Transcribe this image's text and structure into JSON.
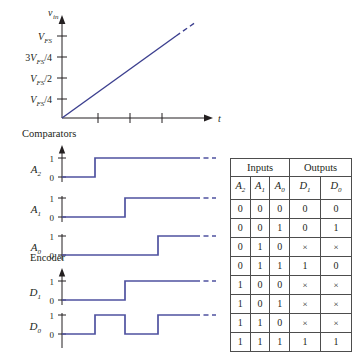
{
  "figure": {
    "title_caption": "",
    "ramp_plot": {
      "y_axis_label": "v",
      "y_axis_sub": "in",
      "x_axis_label": "t",
      "y_ticks": [
        {
          "label_main": "V",
          "label_sub": "FS",
          "label_suffix": "",
          "prefix": "",
          "text": "V_FS"
        },
        {
          "label_main": "3V",
          "label_sub": "FS",
          "label_suffix": "/4",
          "prefix": "3",
          "text": "3V_FS/4"
        },
        {
          "label_main": "V",
          "label_sub": "FS",
          "label_suffix": "/2",
          "prefix": "",
          "text": "V_FS/2"
        },
        {
          "label_main": "V",
          "label_sub": "FS",
          "label_suffix": "/4",
          "prefix": "",
          "text": "V_FS/4"
        }
      ],
      "x_tick_count": 3,
      "line_style": "solid-with-dashed-extension"
    },
    "comparators_section": {
      "title": "Comparators",
      "signals": [
        {
          "name": "A",
          "sub": "2",
          "high_label": "1",
          "low_label": "0",
          "transition_x": 95,
          "initial": 0
        },
        {
          "name": "A",
          "sub": "1",
          "high_label": "1",
          "low_label": "0",
          "transition_x": 125,
          "initial": 0
        },
        {
          "name": "A",
          "sub": "0",
          "high_label": "1",
          "low_label": "0",
          "transition_x": 158,
          "initial": 0
        }
      ]
    },
    "encoder_section": {
      "title": "Encoder",
      "signals": [
        {
          "name": "D",
          "sub": "1",
          "high_label": "1",
          "low_label": "0",
          "pattern": "0,1 at 125",
          "initial": 0
        },
        {
          "name": "D",
          "sub": "0",
          "high_label": "1",
          "low_label": "0",
          "pattern": "0,1,0,1 toggling",
          "initial": 0
        }
      ]
    }
  },
  "truth_table": {
    "group_headers": [
      {
        "label": "Inputs",
        "span": 3
      },
      {
        "label": "Outputs",
        "span": 2
      }
    ],
    "column_headers": [
      {
        "name": "A",
        "sub": "2"
      },
      {
        "name": "A",
        "sub": "1"
      },
      {
        "name": "A",
        "sub": "0"
      },
      {
        "name": "D",
        "sub": "1"
      },
      {
        "name": "D",
        "sub": "0"
      }
    ],
    "rows": [
      {
        "A2": "0",
        "A1": "0",
        "A0": "0",
        "D1": "0",
        "D0": "0"
      },
      {
        "A2": "0",
        "A1": "0",
        "A0": "1",
        "D1": "0",
        "D0": "1"
      },
      {
        "A2": "0",
        "A1": "1",
        "A0": "0",
        "D1": "×",
        "D0": "×"
      },
      {
        "A2": "0",
        "A1": "1",
        "A0": "1",
        "D1": "1",
        "D0": "0"
      },
      {
        "A2": "1",
        "A1": "0",
        "A0": "0",
        "D1": "×",
        "D0": "×"
      },
      {
        "A2": "1",
        "A1": "0",
        "A0": "1",
        "D1": "×",
        "D0": "×"
      },
      {
        "A2": "1",
        "A1": "1",
        "A0": "0",
        "D1": "×",
        "D0": "×"
      },
      {
        "A2": "1",
        "A1": "1",
        "A0": "1",
        "D1": "1",
        "D0": "1"
      }
    ]
  },
  "colors": {
    "waveform": "#4f52a0",
    "ramp": "#3c3f8f",
    "axis": "#231f20",
    "table_border": "#4d4d4d",
    "text": "#231f20",
    "background": "#ffffff"
  }
}
